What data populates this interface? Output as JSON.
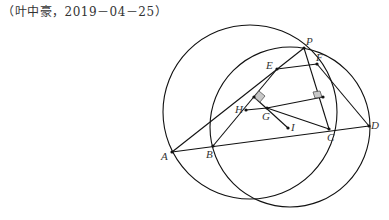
{
  "caption": "（叶中豪，2019－04－25）",
  "points": {
    "P": {
      "label": "P",
      "x": 304,
      "y": 48
    },
    "E": {
      "label": "E",
      "x": 277,
      "y": 69
    },
    "F": {
      "label": "F",
      "x": 317,
      "y": 64
    },
    "H": {
      "label": "H",
      "x": 246,
      "y": 110
    },
    "G": {
      "label": "G",
      "x": 267,
      "y": 108
    },
    "I": {
      "label": "I",
      "x": 288,
      "y": 128
    },
    "A": {
      "label": "A",
      "x": 172,
      "y": 152
    },
    "B": {
      "label": "B",
      "x": 213,
      "y": 146
    },
    "C": {
      "label": "C",
      "x": 329,
      "y": 129
    },
    "D": {
      "label": "D",
      "x": 369,
      "y": 126
    }
  },
  "circles": [
    {
      "name": "circle-APC",
      "cx": 250,
      "cy": 112,
      "r": 87
    },
    {
      "name": "circle-BPD",
      "cx": 290,
      "cy": 127,
      "r": 80
    }
  ],
  "colors": {
    "stroke": "#111111",
    "marker_fill": "#c8c8c8"
  }
}
